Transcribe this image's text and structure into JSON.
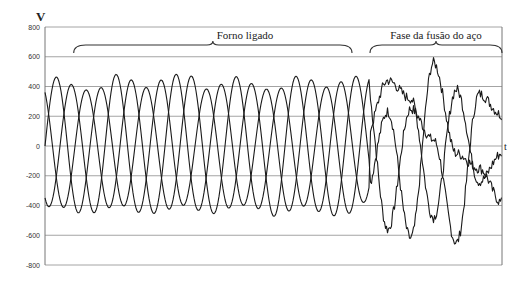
{
  "chart_data": {
    "type": "line",
    "title": "",
    "xlabel": "t",
    "ylabel": "V",
    "ylim": [
      -800,
      800
    ],
    "yticks": [
      800,
      600,
      400,
      200,
      0,
      -200,
      -400,
      -600,
      -800
    ],
    "ytick_labels": [
      "800",
      "600",
      "400",
      "200",
      "0",
      "-200",
      "-400",
      "-600",
      "-800"
    ],
    "grid": true,
    "legend": null,
    "annotations": [
      {
        "text": "Forno ligado",
        "span_fraction": [
          0.03,
          0.67
        ]
      },
      {
        "text": "Fase da fusão do aço",
        "span_fraction": [
          0.71,
          1.0
        ]
      }
    ],
    "regions": {
      "forno_ligado": {
        "description": "three-phase sinusoidal voltages",
        "fraction_of_x": [
          0.0,
          0.71
        ],
        "amplitude_range": [
          420,
          480
        ],
        "cycles_per_phase": 7.2,
        "phase_shift_deg": [
          0,
          120,
          240
        ]
      },
      "fase_fusao": {
        "description": "distorted, noisy three-phase voltages",
        "fraction_of_x": [
          0.71,
          1.0
        ],
        "min": -700,
        "max": 620
      }
    },
    "series": [
      {
        "name": "Phase A",
        "samples_x_fraction": [
          0.0,
          0.05,
          0.1,
          0.15,
          0.2,
          0.25,
          0.3,
          0.35,
          0.4,
          0.45,
          0.5,
          0.55,
          0.6,
          0.65,
          0.7,
          0.75,
          0.8,
          0.85,
          0.9,
          0.95,
          1.0
        ],
        "values": [
          0,
          430,
          -250,
          -290,
          440,
          -20,
          -420,
          300,
          260,
          -470,
          60,
          430,
          -330,
          -190,
          450,
          -560,
          250,
          40,
          -650,
          350,
          210
        ]
      },
      {
        "name": "Phase B",
        "samples_x_fraction": [
          0.0,
          0.05,
          0.1,
          0.15,
          0.2,
          0.25,
          0.3,
          0.35,
          0.4,
          0.45,
          0.5,
          0.55,
          0.6,
          0.65,
          0.7,
          0.75,
          0.8,
          0.85,
          0.9,
          0.95,
          1.0
        ],
        "values": [
          370,
          -360,
          -80,
          450,
          -310,
          -260,
          440,
          -30,
          -430,
          330,
          220,
          -470,
          90,
          440,
          -330,
          230,
          -620,
          560,
          -50,
          -150,
          -380
        ]
      },
      {
        "name": "Phase C",
        "samples_x_fraction": [
          0.0,
          0.05,
          0.1,
          0.15,
          0.2,
          0.25,
          0.3,
          0.35,
          0.4,
          0.45,
          0.5,
          0.55,
          0.6,
          0.65,
          0.7,
          0.75,
          0.8,
          0.85,
          0.9,
          0.95,
          1.0
        ],
        "values": [
          -370,
          -70,
          360,
          -160,
          -130,
          440,
          -170,
          -280,
          460,
          120,
          -470,
          240,
          250,
          -480,
          60,
          440,
          320,
          -480,
          380,
          -240,
          -50
        ]
      }
    ]
  },
  "labels": {
    "y_axis": "V",
    "x_axis": "t",
    "region1": "Forno ligado",
    "region2": "Fase da fusão do aço"
  }
}
